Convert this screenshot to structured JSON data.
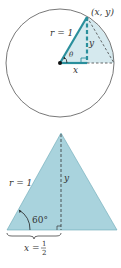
{
  "figure_top": {
    "description": "Unit circle with point (x, y), angle theta, right triangle",
    "labels": {
      "point": "(x, y)",
      "radius": "r = 1",
      "vertical_leg": "y",
      "horizontal_leg": "x",
      "angle": "θ"
    }
  },
  "figure_bottom": {
    "description": "Equilateral triangle with altitude",
    "labels": {
      "side": "r = 1",
      "altitude": "y",
      "angle": "60°",
      "half_base_lhs": "x =",
      "half_base_num": "1",
      "half_base_den": "2"
    }
  },
  "colors": {
    "teal": "#2a8f9c",
    "fill": "#a9d3dd",
    "fill_light": "#d5e9ee",
    "line": "#333333"
  }
}
